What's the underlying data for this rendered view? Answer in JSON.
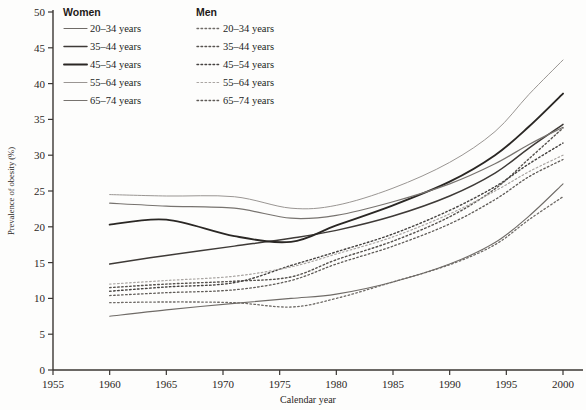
{
  "chart_data": {
    "type": "line",
    "title": "",
    "xlabel": "Calendar year",
    "ylabel": "Prevalence of obesity (%)",
    "xlim": [
      1955,
      2000
    ],
    "ylim": [
      0,
      50
    ],
    "xticks": [
      1955,
      1960,
      1965,
      1970,
      1975,
      1980,
      1985,
      1990,
      1995,
      2000
    ],
    "yticks": [
      0,
      5,
      10,
      15,
      20,
      25,
      30,
      35,
      40,
      45,
      50
    ],
    "grid": false,
    "legend_position": "top-left inside plot",
    "legend_groups": [
      {
        "heading": "Women",
        "style": "solid",
        "entries": [
          "20–34 years",
          "35–44 years",
          "45–54 years",
          "55–64 years",
          "65–74 years"
        ]
      },
      {
        "heading": "Men",
        "style": "dashed",
        "entries": [
          "20–34 years",
          "35–44 years",
          "45–54 years",
          "55–64 years",
          "65–74 years"
        ]
      }
    ],
    "x": [
      1960,
      1965,
      1971,
      1976,
      1980,
      1985,
      1990,
      1994,
      1997,
      2000
    ],
    "series": [
      {
        "name": "Women 20–34 years",
        "sex": "Women",
        "age": "20–34 years",
        "style": "solid",
        "color": "#6f6b67",
        "width": 1.1,
        "values": [
          7.5,
          8.4,
          9.3,
          10.0,
          10.6,
          12.3,
          14.8,
          17.8,
          21.5,
          26.0
        ]
      },
      {
        "name": "Women 35–44 years",
        "sex": "Women",
        "age": "35–44 years",
        "style": "solid",
        "color": "#3e3a37",
        "width": 1.5,
        "values": [
          14.8,
          16.0,
          17.3,
          18.4,
          19.5,
          21.5,
          24.3,
          27.5,
          31.0,
          34.3
        ]
      },
      {
        "name": "Women 45–54 years",
        "sex": "Women",
        "age": "45–54 years",
        "style": "solid",
        "color": "#2a2724",
        "width": 1.9,
        "values": [
          20.3,
          21.0,
          18.7,
          17.9,
          20.2,
          23.0,
          26.3,
          30.0,
          34.0,
          38.6
        ]
      },
      {
        "name": "Women 55–64 years",
        "sex": "Women",
        "age": "55–64 years",
        "style": "solid",
        "color": "#9a9693",
        "width": 1.0,
        "values": [
          24.5,
          24.3,
          24.2,
          22.6,
          23.0,
          25.4,
          29.0,
          33.3,
          38.5,
          43.3
        ]
      },
      {
        "name": "Women 65–74 years",
        "sex": "Women",
        "age": "65–74 years",
        "style": "solid",
        "color": "#77736f",
        "width": 1.2,
        "values": [
          23.3,
          22.9,
          22.6,
          21.2,
          21.6,
          23.5,
          26.0,
          28.8,
          31.5,
          33.9
        ]
      },
      {
        "name": "Men 20–34 years",
        "sex": "Men",
        "age": "20–34 years",
        "style": "dashed",
        "color": "#6f6b67",
        "width": 1.3,
        "values": [
          9.4,
          9.5,
          9.4,
          8.8,
          10.0,
          12.3,
          14.7,
          17.5,
          21.0,
          24.2
        ]
      },
      {
        "name": "Men 35–44 years",
        "sex": "Men",
        "age": "35–44 years",
        "style": "dashed",
        "color": "#57534f",
        "width": 1.4,
        "values": [
          11.5,
          12.0,
          12.4,
          13.0,
          15.4,
          18.0,
          21.4,
          25.3,
          29.5,
          33.8
        ]
      },
      {
        "name": "Men 45–54 years",
        "sex": "Men",
        "age": "45–54 years",
        "style": "dashed",
        "color": "#454240",
        "width": 1.4,
        "values": [
          11.0,
          11.6,
          12.2,
          14.6,
          16.5,
          19.0,
          22.3,
          25.6,
          28.8,
          31.7
        ]
      },
      {
        "name": "Men 55–64 years",
        "sex": "Men",
        "age": "55–64 years",
        "style": "dashed",
        "color": "#a9a5a2",
        "width": 1.2,
        "values": [
          12.0,
          12.5,
          13.1,
          14.4,
          16.2,
          18.6,
          21.8,
          25.0,
          27.7,
          30.0
        ]
      },
      {
        "name": "Men 65–74 years",
        "sex": "Men",
        "age": "65–74 years",
        "style": "dashed",
        "color": "#5f5b57",
        "width": 1.3,
        "values": [
          10.4,
          10.8,
          11.2,
          12.5,
          14.8,
          17.3,
          20.4,
          23.8,
          27.0,
          29.4
        ]
      }
    ]
  }
}
